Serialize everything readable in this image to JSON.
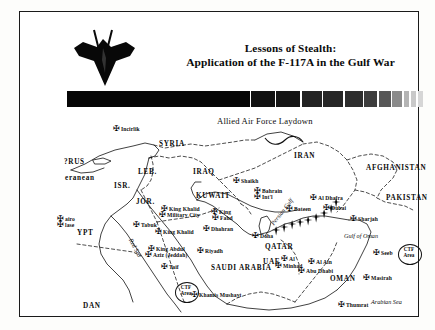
{
  "slide": {
    "title_line1": "Lessons of Stealth:",
    "title_line2": "Application of the F-117A in the Gulf War",
    "emblem": "f117-nighthawk-silhouette",
    "gradient_bar": {
      "name": "grayscale-gradient-bar",
      "segments": [
        "#060606",
        "#111111",
        "#151515",
        "#232323",
        "#262626",
        "#2d2d2d",
        "#3d3d3d",
        "#575757",
        "#8a8a8a",
        "#b4b4b4",
        "#c9c9c9",
        "#d6d6d6"
      ],
      "widths": [
        200,
        26,
        26,
        22,
        22,
        20,
        14,
        13,
        11,
        6,
        6,
        6
      ]
    }
  },
  "map": {
    "heading": "Allied Air Force Laydown",
    "countries": [
      {
        "label": "SYRIA",
        "x": 118,
        "y": 28
      },
      {
        "label": "IRAQ",
        "x": 152,
        "y": 56
      },
      {
        "label": "IRAN",
        "x": 253,
        "y": 40
      },
      {
        "label": "AFGHANISTAN",
        "x": 325,
        "y": 52
      },
      {
        "label": "PAKISTAN",
        "x": 345,
        "y": 82
      },
      {
        "label": "KUWAIT",
        "x": 155,
        "y": 80
      },
      {
        "label": "LEB.",
        "x": 97,
        "y": 56
      },
      {
        "label": "ISR.",
        "x": 73,
        "y": 70
      },
      {
        "label": "JOR.",
        "x": 95,
        "y": 86
      },
      {
        "label": "QATAR",
        "x": 224,
        "y": 131
      },
      {
        "label": "UAE",
        "x": 222,
        "y": 146
      },
      {
        "label": "OMAN",
        "x": 289,
        "y": 163
      },
      {
        "label": "SAUDI ARABIA",
        "x": 170,
        "y": 152
      },
      {
        "label": "YPT",
        "x": 36,
        "y": 117
      },
      {
        "label": "DAN",
        "x": 42,
        "y": 190
      },
      {
        "label": "?RUS",
        "x": 23,
        "y": 46
      },
      {
        "label": "eranean",
        "x": 24,
        "y": 62
      }
    ],
    "waters": [
      {
        "label": "Red Sea",
        "x": 93,
        "y": 125,
        "rotate": 62
      },
      {
        "label": "Persian Gulf",
        "x": 228,
        "y": 110,
        "rotate": -52
      },
      {
        "label": "Gulf of Oman",
        "x": 303,
        "y": 120
      },
      {
        "label": "Arabian Sea",
        "x": 330,
        "y": 186
      }
    ],
    "bases": [
      {
        "label": "Incirlik",
        "x": 80,
        "y": 14
      },
      {
        "label": "Tabuk",
        "x": 100,
        "y": 110
      },
      {
        "label": "airo",
        "x": 24,
        "y": 104
      },
      {
        "label": "lase",
        "x": 24,
        "y": 110
      },
      {
        "label": "King Khalid",
        "x": 128,
        "y": 94
      },
      {
        "label": "Military City",
        "x": 126,
        "y": 100
      },
      {
        "label": "King",
        "x": 178,
        "y": 97
      },
      {
        "label": "Fahd",
        "x": 179,
        "y": 103
      },
      {
        "label": "Dhahran",
        "x": 170,
        "y": 114
      },
      {
        "label": "King Khalid",
        "x": 122,
        "y": 117
      },
      {
        "label": "King Abdul",
        "x": 115,
        "y": 134
      },
      {
        "label": "Aziz (Jeddah)",
        "x": 112,
        "y": 140
      },
      {
        "label": "Riyadh",
        "x": 164,
        "y": 136
      },
      {
        "label": "Taif",
        "x": 128,
        "y": 152
      },
      {
        "label": "Khamis Mushayt",
        "x": 158,
        "y": 180
      },
      {
        "label": "Shaikh",
        "x": 200,
        "y": 66
      },
      {
        "label": "Bahrain",
        "x": 221,
        "y": 76
      },
      {
        "label": "Int'l",
        "x": 221,
        "y": 82
      },
      {
        "label": "Doha",
        "x": 219,
        "y": 121
      },
      {
        "label": "Bateen",
        "x": 253,
        "y": 94
      },
      {
        "label": "Al Dhafra",
        "x": 277,
        "y": 83
      },
      {
        "label": "Dubai",
        "x": 290,
        "y": 93
      },
      {
        "label": "Sharjah",
        "x": 317,
        "y": 104
      },
      {
        "label": "Al Ain",
        "x": 275,
        "y": 147
      },
      {
        "label": "Al",
        "x": 248,
        "y": 144
      },
      {
        "label": "Minhad",
        "x": 242,
        "y": 151
      },
      {
        "label": "Abu Dhabi",
        "x": 265,
        "y": 156
      },
      {
        "label": "Seeb",
        "x": 340,
        "y": 138
      },
      {
        "label": "Masirah",
        "x": 330,
        "y": 163
      },
      {
        "label": "Thumrat",
        "x": 305,
        "y": 190
      }
    ],
    "ctf_areas": [
      {
        "line1": "CTF",
        "line2": "Area",
        "x": 134,
        "y": 170
      },
      {
        "line1": "CTF",
        "line2": "Area",
        "x": 357,
        "y": 132
      }
    ]
  }
}
